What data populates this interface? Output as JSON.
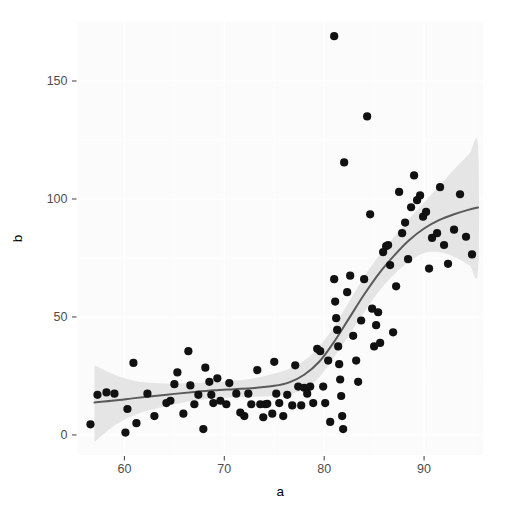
{
  "chart_data": {
    "type": "scatter",
    "title": "",
    "subtitle": "",
    "xlabel": "a",
    "ylabel": "b",
    "xlim": [
      55.3,
      95.9
    ],
    "ylim": [
      -8.5,
      175.0
    ],
    "x_ticks": [
      60,
      70,
      80,
      90
    ],
    "x_tick_labels": [
      "60",
      "70",
      "80",
      "90"
    ],
    "y_ticks": [
      0,
      50,
      100,
      150
    ],
    "y_tick_labels": [
      "0",
      "50",
      "100",
      "150"
    ],
    "grid": true,
    "grid_color": "#ffffff",
    "panel_background": "#fbfbfb",
    "legend": "none",
    "point_color": "#111111",
    "point_size": 4.1,
    "smooth_line_color": "#5a5a5a",
    "smooth_band_color": "#e3e3e3",
    "smooth_method": "loess",
    "points": [
      [
        56.6,
        4.5
      ],
      [
        57.3,
        17.0
      ],
      [
        58.2,
        18.0
      ],
      [
        59.0,
        17.5
      ],
      [
        60.1,
        1.0
      ],
      [
        60.3,
        11.0
      ],
      [
        60.9,
        30.5
      ],
      [
        61.2,
        5.0
      ],
      [
        62.3,
        17.5
      ],
      [
        63.0,
        8.0
      ],
      [
        64.2,
        13.5
      ],
      [
        64.6,
        14.5
      ],
      [
        65.0,
        21.5
      ],
      [
        65.3,
        26.5
      ],
      [
        65.9,
        9.0
      ],
      [
        66.4,
        35.5
      ],
      [
        66.6,
        21.0
      ],
      [
        67.0,
        13.0
      ],
      [
        67.4,
        17.0
      ],
      [
        67.9,
        2.5
      ],
      [
        68.1,
        28.5
      ],
      [
        68.5,
        22.5
      ],
      [
        68.7,
        17.0
      ],
      [
        68.9,
        13.5
      ],
      [
        69.3,
        24.0
      ],
      [
        69.6,
        14.5
      ],
      [
        70.2,
        13.0
      ],
      [
        70.5,
        22.0
      ],
      [
        71.2,
        17.5
      ],
      [
        71.6,
        9.5
      ],
      [
        72.0,
        8.0
      ],
      [
        72.4,
        17.5
      ],
      [
        72.7,
        13.0
      ],
      [
        73.3,
        27.5
      ],
      [
        73.6,
        13.0
      ],
      [
        73.9,
        7.5
      ],
      [
        74.1,
        13.0
      ],
      [
        74.3,
        13.2
      ],
      [
        74.8,
        9.0
      ],
      [
        75.0,
        31.0
      ],
      [
        75.2,
        17.5
      ],
      [
        75.5,
        13.5
      ],
      [
        75.9,
        8.0
      ],
      [
        76.3,
        17.0
      ],
      [
        76.8,
        12.5
      ],
      [
        77.1,
        29.5
      ],
      [
        77.4,
        20.5
      ],
      [
        77.7,
        12.5
      ],
      [
        78.0,
        20.0
      ],
      [
        78.3,
        17.5
      ],
      [
        78.6,
        20.5
      ],
      [
        78.9,
        13.5
      ],
      [
        79.3,
        36.5
      ],
      [
        79.6,
        35.5
      ],
      [
        79.9,
        20.5
      ],
      [
        80.1,
        13.5
      ],
      [
        80.4,
        31.5
      ],
      [
        80.6,
        5.5
      ],
      [
        81.0,
        66.0
      ],
      [
        81.1,
        56.5
      ],
      [
        81.2,
        49.5
      ],
      [
        81.3,
        44.5
      ],
      [
        81.4,
        37.5
      ],
      [
        81.5,
        30.0
      ],
      [
        81.6,
        23.5
      ],
      [
        81.7,
        16.5
      ],
      [
        81.8,
        8.0
      ],
      [
        81.9,
        2.5
      ],
      [
        81.0,
        169.0
      ],
      [
        82.0,
        115.5
      ],
      [
        82.3,
        60.5
      ],
      [
        82.6,
        67.5
      ],
      [
        82.9,
        42.0
      ],
      [
        83.2,
        31.5
      ],
      [
        83.4,
        22.5
      ],
      [
        83.7,
        48.5
      ],
      [
        84.0,
        66.0
      ],
      [
        84.3,
        135.0
      ],
      [
        84.6,
        93.5
      ],
      [
        84.8,
        53.5
      ],
      [
        85.0,
        37.5
      ],
      [
        85.2,
        46.5
      ],
      [
        85.4,
        52.0
      ],
      [
        85.6,
        39.0
      ],
      [
        85.9,
        77.5
      ],
      [
        86.2,
        80.0
      ],
      [
        86.4,
        80.5
      ],
      [
        86.6,
        72.0
      ],
      [
        86.9,
        43.5
      ],
      [
        87.2,
        63.0
      ],
      [
        87.5,
        103.0
      ],
      [
        87.8,
        85.5
      ],
      [
        88.1,
        90.0
      ],
      [
        88.4,
        74.5
      ],
      [
        88.7,
        96.5
      ],
      [
        89.0,
        110.0
      ],
      [
        89.3,
        99.5
      ],
      [
        89.6,
        101.5
      ],
      [
        89.9,
        92.5
      ],
      [
        90.2,
        94.5
      ],
      [
        90.5,
        70.5
      ],
      [
        90.8,
        83.5
      ],
      [
        91.3,
        85.5
      ],
      [
        91.6,
        105.0
      ],
      [
        92.0,
        80.5
      ],
      [
        92.4,
        72.5
      ],
      [
        93.0,
        87.0
      ],
      [
        93.6,
        102.0
      ],
      [
        94.2,
        84.0
      ],
      [
        94.8,
        76.5
      ]
    ],
    "smooth_curve": [
      [
        57.0,
        13.8
      ],
      [
        59.0,
        14.6
      ],
      [
        61.0,
        15.6
      ],
      [
        63.0,
        16.5
      ],
      [
        65.0,
        17.4
      ],
      [
        67.0,
        18.2
      ],
      [
        69.0,
        18.9
      ],
      [
        71.0,
        19.4
      ],
      [
        73.0,
        19.9
      ],
      [
        75.0,
        20.8
      ],
      [
        76.5,
        22.3
      ],
      [
        78.0,
        25.5
      ],
      [
        79.5,
        31.0
      ],
      [
        81.0,
        39.5
      ],
      [
        82.5,
        49.5
      ],
      [
        84.0,
        59.5
      ],
      [
        85.5,
        68.5
      ],
      [
        87.0,
        76.0
      ],
      [
        88.5,
        82.5
      ],
      [
        90.0,
        87.5
      ],
      [
        91.5,
        91.0
      ],
      [
        93.0,
        93.5
      ],
      [
        94.5,
        95.5
      ],
      [
        95.4,
        96.4
      ]
    ],
    "smooth_band_upper": [
      [
        57.0,
        29.5
      ],
      [
        59.0,
        25.5
      ],
      [
        61.0,
        23.0
      ],
      [
        63.0,
        22.0
      ],
      [
        65.0,
        21.8
      ],
      [
        67.0,
        22.0
      ],
      [
        69.0,
        22.5
      ],
      [
        71.0,
        23.0
      ],
      [
        73.0,
        24.0
      ],
      [
        75.0,
        26.0
      ],
      [
        76.5,
        28.0
      ],
      [
        78.0,
        31.5
      ],
      [
        79.5,
        37.5
      ],
      [
        81.0,
        46.0
      ],
      [
        82.5,
        56.5
      ],
      [
        84.0,
        67.0
      ],
      [
        85.5,
        76.0
      ],
      [
        87.0,
        84.0
      ],
      [
        88.5,
        91.5
      ],
      [
        90.0,
        98.5
      ],
      [
        91.5,
        105.5
      ],
      [
        93.0,
        112.5
      ],
      [
        94.5,
        119.0
      ],
      [
        95.4,
        122.5
      ]
    ],
    "smooth_band_lower": [
      [
        57.0,
        -3.0
      ],
      [
        59.0,
        4.0
      ],
      [
        61.0,
        8.5
      ],
      [
        63.0,
        11.0
      ],
      [
        65.0,
        13.0
      ],
      [
        67.0,
        14.5
      ],
      [
        69.0,
        15.5
      ],
      [
        71.0,
        16.0
      ],
      [
        73.0,
        16.2
      ],
      [
        75.0,
        16.5
      ],
      [
        76.5,
        17.2
      ],
      [
        78.0,
        19.5
      ],
      [
        79.5,
        24.5
      ],
      [
        81.0,
        33.0
      ],
      [
        82.5,
        42.5
      ],
      [
        84.0,
        52.0
      ],
      [
        85.5,
        61.0
      ],
      [
        87.0,
        68.0
      ],
      [
        88.5,
        73.5
      ],
      [
        90.0,
        77.0
      ],
      [
        91.5,
        77.5
      ],
      [
        93.0,
        75.5
      ],
      [
        94.5,
        72.0
      ],
      [
        95.4,
        69.5
      ]
    ]
  }
}
